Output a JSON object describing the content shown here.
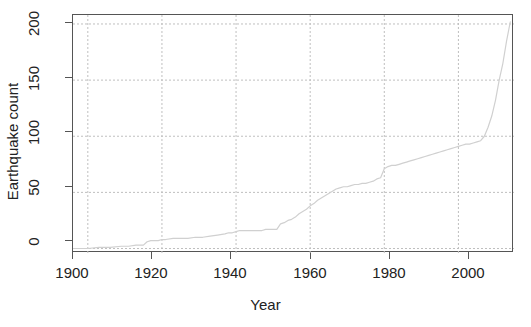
{
  "chart_data": {
    "type": "line",
    "title": "",
    "subtitle": "",
    "xlabel": "Year",
    "ylabel": "Earthquake count",
    "xlim": [
      1896,
      2015
    ],
    "ylim": [
      -4,
      208
    ],
    "xticks": [
      1900,
      1920,
      1940,
      1960,
      1980,
      2000
    ],
    "xticklabels": [
      "1900",
      "1920",
      "1940",
      "1960",
      "1980",
      "2000"
    ],
    "yticks": [
      0,
      50,
      100,
      150,
      200
    ],
    "yticklabels": [
      "0",
      "50",
      "100",
      "150",
      "200"
    ],
    "grid": true,
    "grid_style": "dotted",
    "grid_color": "#bfbfbf",
    "legend": "none",
    "line_color": "#d0d0d0",
    "line_width": 1.2,
    "axis_color": "#555555",
    "background": "#ffffff",
    "series": [
      {
        "name": "Cumulative earthquake count",
        "x": [
          1896,
          1900,
          1903,
          1906,
          1909,
          1911,
          1913,
          1915,
          1916,
          1917,
          1918,
          1919,
          1920,
          1921,
          1923,
          1925,
          1927,
          1929,
          1931,
          1933,
          1935,
          1937,
          1938,
          1939,
          1940,
          1941,
          1942,
          1943,
          1944,
          1945,
          1946,
          1947,
          1948,
          1949,
          1950,
          1951,
          1952,
          1953,
          1954,
          1955,
          1956,
          1957,
          1958,
          1959,
          1960,
          1961,
          1962,
          1963,
          1964,
          1965,
          1966,
          1967,
          1968,
          1969,
          1970,
          1971,
          1972,
          1973,
          1974,
          1975,
          1976,
          1977,
          1978,
          1979,
          1980,
          1981,
          1982,
          1983,
          1984,
          1985,
          1986,
          1987,
          1988,
          1989,
          1990,
          1991,
          1992,
          1993,
          1994,
          1995,
          1996,
          1997,
          1998,
          1999,
          2000,
          2001,
          2002,
          2003,
          2004,
          2005,
          2006,
          2007,
          2008,
          2009,
          2010,
          2011,
          2012,
          2013,
          2014
        ],
        "y": [
          0,
          0,
          1,
          1,
          2,
          2,
          3,
          3,
          6,
          7,
          7,
          7,
          8,
          8,
          9,
          9,
          9,
          10,
          10,
          11,
          12,
          13,
          14,
          14,
          15,
          16,
          16,
          16,
          16,
          16,
          16,
          16,
          17,
          17,
          17,
          17,
          22,
          23,
          25,
          26,
          28,
          31,
          33,
          35,
          38,
          40,
          43,
          45,
          47,
          49,
          51,
          53,
          54,
          55,
          55,
          56,
          57,
          57,
          58,
          58,
          59,
          60,
          62,
          63,
          71,
          73,
          74,
          74,
          75,
          76,
          77,
          78,
          79,
          80,
          81,
          82,
          83,
          84,
          85,
          86,
          87,
          88,
          89,
          90,
          91,
          92,
          93,
          93,
          94,
          95,
          96,
          100,
          108,
          118,
          132,
          150,
          165,
          185,
          202
        ]
      }
    ]
  }
}
